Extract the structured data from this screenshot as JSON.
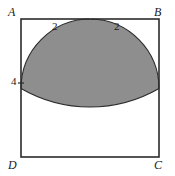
{
  "figure": {
    "kind": "plane-geometry-diagram",
    "shape": "square",
    "shaded_region_fill": "#8e8e8e",
    "outline_color": "#2b2b2b",
    "background": "#ffffff",
    "vertices": [
      {
        "id": "A",
        "label": "A",
        "position": "top-left"
      },
      {
        "id": "B",
        "label": "B",
        "position": "top-right"
      },
      {
        "id": "C",
        "label": "C",
        "position": "bottom-right"
      },
      {
        "id": "D",
        "label": "D",
        "position": "bottom-left"
      }
    ],
    "measures": [
      {
        "id": "top-left-segment",
        "label": "2",
        "edge": "AB",
        "location": "left half of top side"
      },
      {
        "id": "top-right-segment",
        "label": "2",
        "edge": "AB",
        "location": "right half of top side"
      },
      {
        "id": "left-side-mark",
        "label": "4",
        "edge": "AD",
        "location": "left side at arc intersection"
      }
    ],
    "arcs": [
      {
        "id": "arc-from-A",
        "center": "A",
        "radius": "2",
        "note": "quarter arc from midpoint of AB down to left side"
      },
      {
        "id": "arc-from-B",
        "center": "B",
        "radius": "2",
        "note": "quarter arc from midpoint of AB down to right side"
      },
      {
        "id": "arc-bottom",
        "center": "midpoint of AB",
        "radius": "4",
        "note": "semicircular arc tangent to DC"
      }
    ]
  }
}
